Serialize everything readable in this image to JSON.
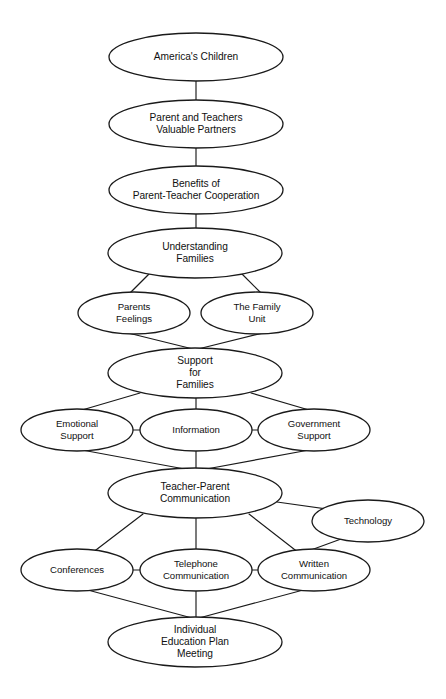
{
  "diagram": {
    "type": "concept-map",
    "title_partial_cropped": "",
    "background_color": "#ffffff",
    "line_color": "#1a1a1a",
    "text_color": "#111111",
    "nodes": [
      {
        "id": "americas-children",
        "label": "America's Children",
        "lines": [
          "America's Children"
        ],
        "cx": 196,
        "cy": 57,
        "rx": 87,
        "ry": 24
      },
      {
        "id": "parent-and-teachers-valuable-partners",
        "label": "Parent and Teachers Valuable Partners",
        "lines": [
          "Parent and Teachers",
          "Valuable Partners"
        ],
        "cx": 196,
        "cy": 124,
        "rx": 87,
        "ry": 24
      },
      {
        "id": "benefits-of-parent-teacher-cooperation",
        "label": "Benefits of Parent-Teacher Cooperation",
        "lines": [
          "Benefits of",
          "Parent-Teacher Cooperation"
        ],
        "cx": 196,
        "cy": 190,
        "rx": 87,
        "ry": 24
      },
      {
        "id": "understanding-families",
        "label": "Understanding Families",
        "lines": [
          "Understanding",
          "Families"
        ],
        "cx": 195,
        "cy": 253,
        "rx": 87,
        "ry": 25
      },
      {
        "id": "parents-feelings",
        "label": "Parents Feelings",
        "lines": [
          "Parents",
          "Feelings"
        ],
        "cx": 134,
        "cy": 313,
        "rx": 56,
        "ry": 21
      },
      {
        "id": "the-family-unit",
        "label": "The Family Unit",
        "lines": [
          "The Family",
          "Unit"
        ],
        "cx": 257,
        "cy": 313,
        "rx": 56,
        "ry": 21
      },
      {
        "id": "support-for-families",
        "label": "Support for Families",
        "lines": [
          "Support",
          "for",
          "Families"
        ],
        "cx": 195,
        "cy": 373,
        "rx": 87,
        "ry": 25
      },
      {
        "id": "emotional-support",
        "label": "Emotional Support",
        "lines": [
          "Emotional",
          "Support"
        ],
        "cx": 77,
        "cy": 430,
        "rx": 56,
        "ry": 21
      },
      {
        "id": "information",
        "label": "Information",
        "lines": [
          "Information"
        ],
        "cx": 196,
        "cy": 430,
        "rx": 56,
        "ry": 21
      },
      {
        "id": "government-support",
        "label": "Government Support",
        "lines": [
          "Government",
          "Support"
        ],
        "cx": 314,
        "cy": 430,
        "rx": 56,
        "ry": 21
      },
      {
        "id": "teacher-parent-communication",
        "label": "Teacher-Parent Communication",
        "lines": [
          "Teacher-Parent",
          "Communication"
        ],
        "cx": 195,
        "cy": 493,
        "rx": 87,
        "ry": 25
      },
      {
        "id": "technology",
        "label": "Technology",
        "lines": [
          "Technology"
        ],
        "cx": 368,
        "cy": 521,
        "rx": 56,
        "ry": 21
      },
      {
        "id": "conferences",
        "label": "Conferences",
        "lines": [
          "Conferences"
        ],
        "cx": 77,
        "cy": 570,
        "rx": 56,
        "ry": 21
      },
      {
        "id": "telephone-communication",
        "label": "Telephone Communication",
        "lines": [
          "Telephone",
          "Communication"
        ],
        "cx": 196,
        "cy": 570,
        "rx": 56,
        "ry": 21
      },
      {
        "id": "written-communication",
        "label": "Written Communication",
        "lines": [
          "Written",
          "Communication"
        ],
        "cx": 314,
        "cy": 570,
        "rx": 56,
        "ry": 21
      },
      {
        "id": "individual-education-plan-meeting",
        "label": "Individual Education Plan Meeting",
        "lines": [
          "Individual",
          "Education Plan",
          "Meeting"
        ],
        "cx": 195,
        "cy": 642,
        "rx": 87,
        "ry": 25
      }
    ],
    "edges": [
      {
        "from": "americas-children",
        "to": "parent-and-teachers-valuable-partners",
        "x1": 196,
        "y1": 81,
        "x2": 196,
        "y2": 100
      },
      {
        "from": "parent-and-teachers-valuable-partners",
        "to": "benefits-of-parent-teacher-cooperation",
        "x1": 196,
        "y1": 148,
        "x2": 196,
        "y2": 166
      },
      {
        "from": "benefits-of-parent-teacher-cooperation",
        "to": "understanding-families",
        "x1": 196,
        "y1": 214,
        "x2": 196,
        "y2": 228
      },
      {
        "from": "understanding-families",
        "to": "parents-feelings",
        "x1": 150,
        "y1": 273,
        "x2": 130,
        "y2": 293
      },
      {
        "from": "understanding-families",
        "to": "the-family-unit",
        "x1": 241,
        "y1": 273,
        "x2": 261,
        "y2": 293
      },
      {
        "from": "parents-feelings",
        "to": "support-for-families",
        "x1": 120,
        "y1": 331,
        "x2": 193,
        "y2": 349
      },
      {
        "from": "the-family-unit",
        "to": "support-for-families",
        "x1": 271,
        "y1": 331,
        "x2": 198,
        "y2": 349
      },
      {
        "from": "support-for-families",
        "to": "emotional-support",
        "x1": 140,
        "y1": 393,
        "x2": 82,
        "y2": 410
      },
      {
        "from": "support-for-families",
        "to": "information",
        "x1": 196,
        "y1": 398,
        "x2": 196,
        "y2": 410
      },
      {
        "from": "support-for-families",
        "to": "government-support",
        "x1": 251,
        "y1": 393,
        "x2": 309,
        "y2": 410
      },
      {
        "from": "emotional-support",
        "to": "information",
        "x1": 133,
        "y1": 430,
        "x2": 140,
        "y2": 430
      },
      {
        "from": "information",
        "to": "government-support",
        "x1": 252,
        "y1": 430,
        "x2": 258,
        "y2": 430
      },
      {
        "from": "emotional-support",
        "to": "teacher-parent-communication",
        "x1": 82,
        "y1": 450,
        "x2": 190,
        "y2": 470
      },
      {
        "from": "information",
        "to": "teacher-parent-communication",
        "x1": 196,
        "y1": 451,
        "x2": 196,
        "y2": 469
      },
      {
        "from": "government-support",
        "to": "teacher-parent-communication",
        "x1": 309,
        "y1": 450,
        "x2": 201,
        "y2": 470
      },
      {
        "from": "teacher-parent-communication",
        "to": "technology",
        "x1": 277,
        "y1": 502,
        "x2": 341,
        "y2": 511
      },
      {
        "from": "technology",
        "to": "written-communication",
        "x1": 352,
        "y1": 535,
        "x2": 300,
        "y2": 554
      },
      {
        "from": "teacher-parent-communication",
        "to": "conferences",
        "x1": 143,
        "y1": 514,
        "x2": 92,
        "y2": 553
      },
      {
        "from": "teacher-parent-communication",
        "to": "telephone-communication",
        "x1": 196,
        "y1": 518,
        "x2": 196,
        "y2": 549
      },
      {
        "from": "teacher-parent-communication",
        "to": "written-communication",
        "x1": 249,
        "y1": 514,
        "x2": 299,
        "y2": 553
      },
      {
        "from": "conferences",
        "to": "telephone-communication",
        "x1": 133,
        "y1": 570,
        "x2": 140,
        "y2": 570
      },
      {
        "from": "telephone-communication",
        "to": "written-communication",
        "x1": 252,
        "y1": 570,
        "x2": 258,
        "y2": 570
      },
      {
        "from": "conferences",
        "to": "individual-education-plan-meeting",
        "x1": 84,
        "y1": 589,
        "x2": 192,
        "y2": 618
      },
      {
        "from": "telephone-communication",
        "to": "individual-education-plan-meeting",
        "x1": 196,
        "y1": 591,
        "x2": 196,
        "y2": 617
      },
      {
        "from": "written-communication",
        "to": "individual-education-plan-meeting",
        "x1": 307,
        "y1": 589,
        "x2": 199,
        "y2": 618
      }
    ]
  }
}
